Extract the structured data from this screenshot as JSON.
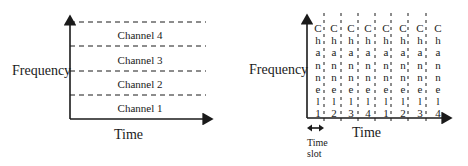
{
  "fdma": {
    "y_axis_label": "Frequency",
    "x_axis_label": "Time",
    "channels": [
      "Channel 4",
      "Channel 3",
      "Channel 2",
      "Channel 1"
    ]
  },
  "tdma": {
    "y_axis_label": "Frequency",
    "x_axis_label": "Time",
    "time_slot_label_line1": "Time",
    "time_slot_label_line2": "slot",
    "slots": [
      {
        "letters": [
          "C",
          "h",
          "a",
          "n",
          "n",
          "e",
          "l",
          "1"
        ]
      },
      {
        "letters": [
          "C",
          "h",
          "a",
          "n",
          "n",
          "e",
          "l",
          "2"
        ]
      },
      {
        "letters": [
          "C",
          "h",
          "a",
          "n",
          "n",
          "e",
          "l",
          "3"
        ]
      },
      {
        "letters": [
          "C",
          "h",
          "a",
          "n",
          "n",
          "e",
          "l",
          "4"
        ]
      },
      {
        "letters": [
          "C",
          "h",
          "a",
          "n",
          "n",
          "e",
          "l",
          "1"
        ]
      },
      {
        "letters": [
          "C",
          "h",
          "a",
          "n",
          "n",
          "e",
          "l",
          "2"
        ]
      },
      {
        "letters": [
          "C",
          "h",
          "a",
          "n",
          "n",
          "e",
          "l",
          "3"
        ]
      },
      {
        "letters": [
          "C",
          "h",
          "a",
          "n",
          "n",
          "e",
          "l",
          "4"
        ]
      }
    ]
  },
  "colors": {
    "ink": "#1a1a1a",
    "background": "#ffffff"
  }
}
